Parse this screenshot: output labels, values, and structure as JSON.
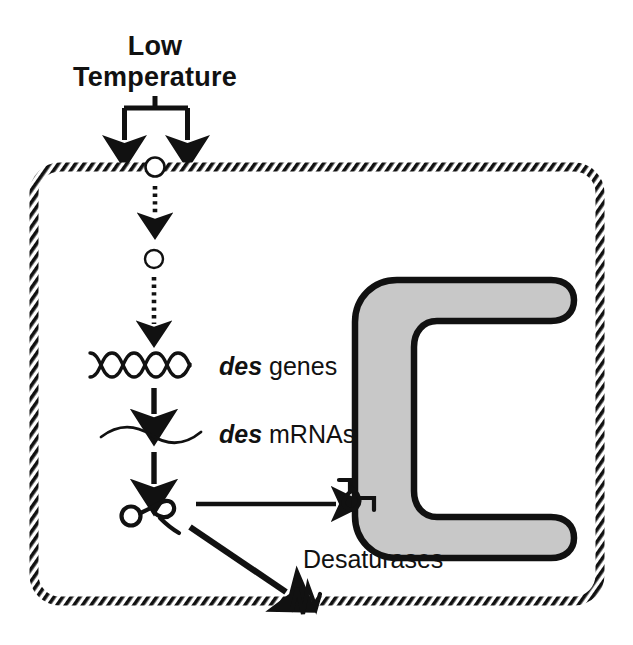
{
  "figure": {
    "title": "Low Temperature",
    "type": "cell-signaling-diagram",
    "background_color": "#ffffff",
    "ink_color": "#111111",
    "organelle_fill": "#c8c8c8"
  },
  "stimulus": {
    "label_line1": "Low",
    "label_line2": "Temperature",
    "label_full": "Low Temperature",
    "fork_arrow_count": 2
  },
  "membrane": {
    "name": "plasma-membrane",
    "style": "hatched-band",
    "band_color": "#111111"
  },
  "sensor": {
    "name": "membrane-sensor",
    "shape": "circle",
    "fill": "#ffffff"
  },
  "transducer": {
    "name": "signal-transducer",
    "shape": "circle",
    "fill": "#ffffff"
  },
  "genes": {
    "label_italic": "des",
    "label_rest": " genes",
    "label_full": "des genes",
    "glyph": "dna-double-helix"
  },
  "mrna": {
    "label_italic": "des",
    "label_rest": " mRNAs",
    "label_full": "des mRNAs",
    "glyph": "wavy-transcript"
  },
  "protein": {
    "label": "Desaturases",
    "glyph": "squiggle-protein",
    "destinations": [
      "thylakoid-membrane",
      "plasma-membrane"
    ]
  },
  "organelle": {
    "name": "thylakoid-membrane",
    "shape": "C-shape",
    "fill": "#c8c8c8",
    "outline": "#111111"
  },
  "arrows": {
    "dotted_signal_1": "dotted-arrow-down",
    "dotted_signal_2": "dotted-arrow-down",
    "transcription": "solid-arrow-down",
    "translation": "solid-arrow-down",
    "targeting_thylakoid": "solid-arrow-right",
    "targeting_plasma": "solid-arrow-diagonal"
  }
}
